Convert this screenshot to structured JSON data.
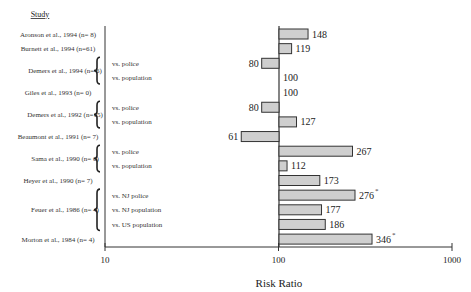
{
  "chart_data": {
    "type": "bar",
    "orientation": "horizontal",
    "scale": "log",
    "title": "",
    "column_header": "Study",
    "xlabel": "Risk Ratio",
    "xlim": [
      10,
      1000
    ],
    "xticks": [
      10,
      100,
      1000
    ],
    "reference_line": 100,
    "grid": false,
    "rows": [
      {
        "study": "Aronson et al., 1994 (n=  8)",
        "sub": "",
        "value": 148,
        "sig": false
      },
      {
        "study": "Burnett et al., 1994 (n=61)",
        "sub": "",
        "value": 119,
        "sig": false
      },
      {
        "study": "Demers et al., 1994 (n=  6)",
        "sub": "vs. police",
        "value": 80,
        "sig": false
      },
      {
        "study": "Demers et al., 1994 (n=  6)",
        "sub": "vs. population",
        "value": 100,
        "sig": false
      },
      {
        "study": "Giles et al., 1993 (n=  0)",
        "sub": "",
        "value": 100,
        "sig": false
      },
      {
        "study": "Demers et al., 1992 (n=15)",
        "sub": "vs. police",
        "value": 80,
        "sig": false
      },
      {
        "study": "Demers et al., 1992 (n=15)",
        "sub": "vs. population",
        "value": 127,
        "sig": false
      },
      {
        "study": "Beaumont et al., 1991 (n=  7)",
        "sub": "",
        "value": 61,
        "sig": false
      },
      {
        "study": "Sama et al., 1990 (n=  6)",
        "sub": "vs. police",
        "value": 267,
        "sig": false
      },
      {
        "study": "Sama et al., 1990 (n=  6)",
        "sub": "vs. population",
        "value": 112,
        "sig": false
      },
      {
        "study": "Heyer et al., 1990 (n=  7)",
        "sub": "",
        "value": 173,
        "sig": false
      },
      {
        "study": "Feuer et al., 1986 (n=  4)",
        "sub": "vs. NJ police",
        "value": 276,
        "sig": true
      },
      {
        "study": "Feuer et al., 1986 (n=  4)",
        "sub": "vs. NJ population",
        "value": 177,
        "sig": false
      },
      {
        "study": "Feuer et al., 1986 (n=  4)",
        "sub": "vs. US population",
        "value": 186,
        "sig": false
      },
      {
        "study": "Morton et al., 1984 (n=  4)",
        "sub": "",
        "value": 346,
        "sig": true
      }
    ],
    "groups": [
      {
        "label": "Aronson et al., 1994 (n=  8)",
        "rows": [
          0
        ]
      },
      {
        "label": "Burnett et al., 1994 (n=61)",
        "rows": [
          1
        ]
      },
      {
        "label": "Demers et al., 1994 (n=  6)",
        "rows": [
          2,
          3
        ]
      },
      {
        "label": "Giles et al., 1993 (n=  0)",
        "rows": [
          4
        ]
      },
      {
        "label": "Demers et al., 1992 (n=15)",
        "rows": [
          5,
          6
        ]
      },
      {
        "label": "Beaumont et al., 1991 (n=  7)",
        "rows": [
          7
        ]
      },
      {
        "label": "Sama et al., 1990 (n=  6)",
        "rows": [
          8,
          9
        ]
      },
      {
        "label": "Heyer et al., 1990 (n=  7)",
        "rows": [
          10
        ]
      },
      {
        "label": "Feuer et al., 1986 (n=  4)",
        "rows": [
          11,
          12,
          13
        ]
      },
      {
        "label": "Morton et al., 1984 (n=  4)",
        "rows": [
          14
        ]
      }
    ],
    "significance_marker": "*"
  }
}
